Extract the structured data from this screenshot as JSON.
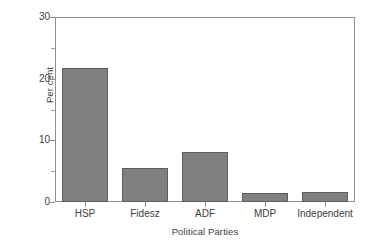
{
  "chart_data": {
    "type": "bar",
    "title": "",
    "subtitle": "",
    "xlabel": "Political Parties",
    "ylabel": "Per cent",
    "categories": [
      "HSP",
      "Fidesz",
      "ADF",
      "MDP",
      "Independent"
    ],
    "values": [
      21.7,
      5.5,
      8.1,
      1.5,
      1.6
    ],
    "series": [
      {
        "name": "Per cent",
        "values": [
          21.7,
          5.5,
          8.1,
          1.5,
          1.6
        ]
      }
    ],
    "ylim": [
      0,
      30
    ],
    "y_major_ticks": [
      0,
      10,
      20,
      30
    ],
    "y_major_tick_labels": [
      "0",
      "10",
      "20",
      "30"
    ],
    "y_minor_ticks": [
      5,
      15,
      25
    ],
    "grid": false,
    "legend": false,
    "legend_position": "none",
    "bar_color": "#808080",
    "bar_edge_color": "#5d5d5d",
    "axis_color": "#8e8e8e",
    "text_color": "#3d3d3d",
    "background_color": "#ffffff",
    "annotations": []
  }
}
